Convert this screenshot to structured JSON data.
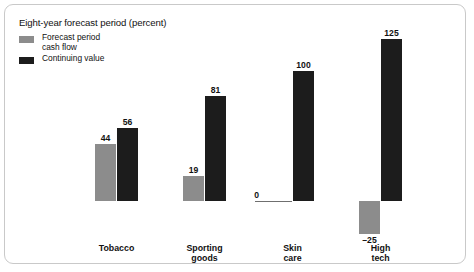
{
  "chart_data": {
    "type": "bar",
    "title": "Eight-year forecast period (percent)",
    "xlabel": "",
    "ylabel": "",
    "ylim": [
      -25,
      125
    ],
    "grid": false,
    "legend_position": "top-left",
    "categories": [
      "Tobacco",
      "Sporting goods",
      "Skin care",
      "High tech"
    ],
    "category_lines": [
      [
        "Tobacco",
        ""
      ],
      [
        "Sporting",
        "goods"
      ],
      [
        "Skin",
        "care"
      ],
      [
        "High",
        "tech"
      ]
    ],
    "series": [
      {
        "name": "Forecast period cash flow",
        "color": "#8c8c8c",
        "values": [
          44,
          19,
          0,
          -25
        ],
        "labels": [
          "44",
          "19",
          "0",
          "–25"
        ]
      },
      {
        "name": "Continuing value",
        "color": "#1c1c1c",
        "values": [
          56,
          81,
          100,
          125
        ],
        "labels": [
          "56",
          "81",
          "100",
          "125"
        ]
      }
    ]
  },
  "legend": {
    "items": [
      {
        "label_line1": "Forecast period",
        "label_line2": "cash flow",
        "color": "#8c8c8c"
      },
      {
        "label_line1": "Continuing value",
        "label_line2": "",
        "color": "#1c1c1c"
      }
    ]
  },
  "colors": {
    "forecast_gray": "#8c8c8c",
    "continuing_black": "#1c1c1c",
    "panel_border": "#c9c9c9",
    "text": "#111111",
    "zero_rule": "#6f6f6f"
  }
}
